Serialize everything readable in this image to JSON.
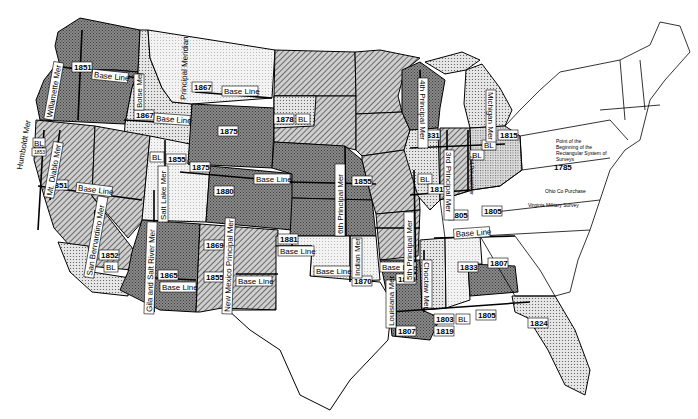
{
  "map": {
    "title": "Principal Meridians and Base Lines of the Public Land Survey System",
    "colors": {
      "background": "#ffffff",
      "outline": "#000000",
      "dark_fill": "#7a7a7a",
      "hatch_fill": "#a8a8a8",
      "dot_fill": "#d9d9d9",
      "light_dot_fill": "#ececec"
    },
    "meridians": [
      {
        "name": "Humboldt Mer"
      },
      {
        "name": "Willamette Mer"
      },
      {
        "name": "Boise Mer"
      },
      {
        "name": "Principal Meridian"
      },
      {
        "name": "Mt. Diablo Mer"
      },
      {
        "name": "San Bernardino Mer"
      },
      {
        "name": "Salt Lake Mer"
      },
      {
        "name": "Wind R Mer"
      },
      {
        "name": "Uintah Mer"
      },
      {
        "name": "Ute Mer"
      },
      {
        "name": "Gila and Salt River Mer"
      },
      {
        "name": "New Mexico Principal Mer"
      },
      {
        "name": "Cimarron Mer"
      },
      {
        "name": "6th Principal Mer"
      },
      {
        "name": "Indian Mer"
      },
      {
        "name": "5th Principal Mer"
      },
      {
        "name": "4th Principal Mer"
      },
      {
        "name": "3rd Principal Mer"
      },
      {
        "name": "2nd Principal Mer"
      },
      {
        "name": "Michigan Mer"
      },
      {
        "name": "Louisiana Mer"
      },
      {
        "name": "Choctaw Mer"
      },
      {
        "name": "St. Helena Mer"
      },
      {
        "name": "Washington Mer"
      },
      {
        "name": "St. Stephens Mer"
      },
      {
        "name": "Huntsville Mer"
      },
      {
        "name": "Tallahassee Mer"
      }
    ],
    "labels": {
      "base_line": "Base Line",
      "bl": "BL",
      "navajo_bl": "Navajo BL",
      "pm_4th_ext": "4th PM extended",
      "mt_sig": "Mt. Sig",
      "ohio_co_purchase": "Ohio Co Purchase",
      "virginia_military_survey": "Virginia Military Survey",
      "point_of_beginning": [
        "Point of the",
        "Beginning of the",
        "Rectangular System of",
        "Surveys"
      ],
      "symmes_purchase": "Symmes Purchase",
      "w_res": "W Res",
      "muskingum": "Muskingum R"
    },
    "years": {
      "wa_1851": "1851",
      "ca_1851": "1851",
      "ca_1853": "1853",
      "ca_1852": "1852",
      "mt_1867": "1867",
      "id_1867": "1867",
      "wy_1875": "1875",
      "ut_1855": "1855",
      "ut_1875": "1875",
      "co_1880": "1880",
      "sd_1878": "1878",
      "ne_1855": "1855",
      "az_1865": "1865",
      "nm_1869": "1869",
      "nm_1855": "1855",
      "ok_1881": "1881",
      "ok_1870": "1870",
      "ar_1815": "1815",
      "il_1815": "1815",
      "wi_1831": "1831",
      "mi_1815": "1815",
      "oh_1805": "1805",
      "in_1805": "1805",
      "in_1805b": "1805",
      "oh_1785": "1785",
      "oh_1819": "1819",
      "ms_1833": "1833",
      "al_1807": "1807",
      "la_1807": "1807",
      "ms_1803": "1803",
      "ms_1819": "1819",
      "al_1805": "1805",
      "fl_1824": "1824",
      "ms_1821": "1821",
      "oh_1802": "1802"
    }
  }
}
